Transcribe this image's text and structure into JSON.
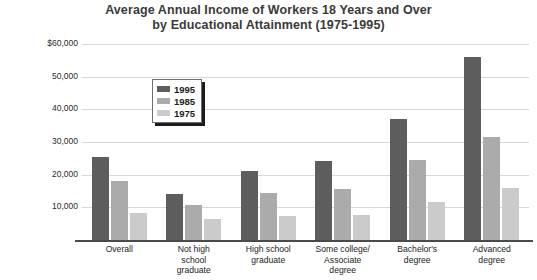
{
  "chart_data": {
    "type": "bar",
    "title": "Average Annual Income of Workers 18 Years and Over by Educational Attainment (1975-1995)",
    "title_line1": "Average Annual Income of Workers 18 Years and Over",
    "title_line2": "by Educational Attainment (1975-1995)",
    "xlabel": "",
    "ylabel": "",
    "ylim": [
      0,
      60000
    ],
    "grid": true,
    "legend_position": "upper-left-inside",
    "categories": [
      "Overall",
      "Not high school graduate",
      "High school graduate",
      "Some college/ Associate degree",
      "Bachelor's degree",
      "Advanced degree"
    ],
    "category_lines": [
      [
        "Overall"
      ],
      [
        "Not high",
        "school",
        "graduate"
      ],
      [
        "High school",
        "graduate"
      ],
      [
        "Some college/",
        "Associate",
        "degree"
      ],
      [
        "Bachelor's",
        "degree"
      ],
      [
        "Advanced",
        "degree"
      ]
    ],
    "ticks": [
      {
        "label": "$60,000",
        "value": 60000
      },
      {
        "label": "50,000",
        "value": 50000
      },
      {
        "label": "40,000",
        "value": 40000
      },
      {
        "label": "30,000",
        "value": 30000
      },
      {
        "label": "20,000",
        "value": 20000
      },
      {
        "label": "10,000",
        "value": 10000
      }
    ],
    "series": [
      {
        "name": "1995",
        "color": "#5d5d5d",
        "values": [
          25500,
          14000,
          21000,
          24300,
          37000,
          56000
        ]
      },
      {
        "name": "1985",
        "color": "#ababab",
        "values": [
          18000,
          10800,
          14500,
          15700,
          24500,
          31500
        ]
      },
      {
        "name": "1975",
        "color": "#cbcbcb",
        "values": [
          8200,
          6500,
          7300,
          7700,
          11500,
          16000
        ]
      }
    ]
  },
  "legend": {
    "items": [
      {
        "label": "1995",
        "color": "#5d5d5d"
      },
      {
        "label": "1985",
        "color": "#ababab"
      },
      {
        "label": "1975",
        "color": "#cbcbcb"
      }
    ]
  },
  "colors": {
    "series_1995": "#5d5d5d",
    "series_1985": "#ababab",
    "series_1975": "#cbcbcb",
    "gridline": "#d8d8d8",
    "axis": "#4a4a4a",
    "title_text": "#3a3a3a",
    "background": "#ffffff"
  }
}
